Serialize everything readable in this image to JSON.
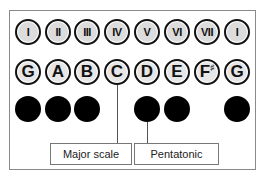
{
  "diagram": {
    "degrees": [
      "I",
      "II",
      "III",
      "IV",
      "V",
      "VI",
      "VII",
      "I"
    ],
    "notes": [
      {
        "letter": "G",
        "accidental": ""
      },
      {
        "letter": "A",
        "accidental": ""
      },
      {
        "letter": "B",
        "accidental": ""
      },
      {
        "letter": "C",
        "accidental": ""
      },
      {
        "letter": "D",
        "accidental": ""
      },
      {
        "letter": "E",
        "accidental": ""
      },
      {
        "letter": "F",
        "accidental": "♯"
      },
      {
        "letter": "G",
        "accidental": ""
      }
    ],
    "pentatonic_dots": [
      true,
      true,
      true,
      false,
      true,
      true,
      false,
      true
    ],
    "labels": {
      "major_scale": "Major scale",
      "pentatonic": "Pentatonic"
    },
    "colors": {
      "outline": "#111111",
      "fill": "#dcdcdc",
      "dot": "#000000",
      "frame": "#8a8a8a"
    }
  }
}
